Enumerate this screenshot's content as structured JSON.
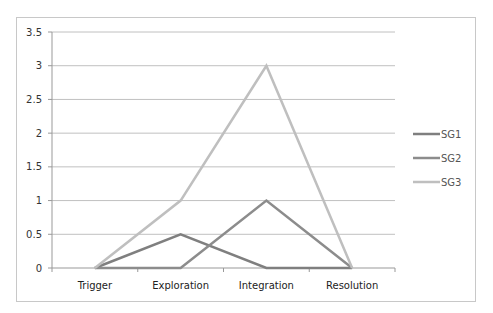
{
  "chart_data": {
    "type": "line",
    "title": "",
    "xlabel": "",
    "ylabel": "",
    "categories": [
      "Trigger",
      "Exploration",
      "Integration",
      "Resolution"
    ],
    "series": [
      {
        "name": "SG1",
        "values": [
          0,
          0.5,
          0,
          0
        ],
        "color": "#7f7f7f"
      },
      {
        "name": "SG2",
        "values": [
          0,
          0,
          1,
          0
        ],
        "color": "#8c8c8c"
      },
      {
        "name": "SG3",
        "values": [
          0,
          1,
          3,
          0
        ],
        "color": "#bfbfbf"
      }
    ],
    "ylim": [
      0,
      3.5
    ],
    "yticks": [
      "0",
      "0.5",
      "1",
      "1.5",
      "2",
      "2.5",
      "3",
      "3.5"
    ],
    "grid": true,
    "legend_position": "right"
  }
}
